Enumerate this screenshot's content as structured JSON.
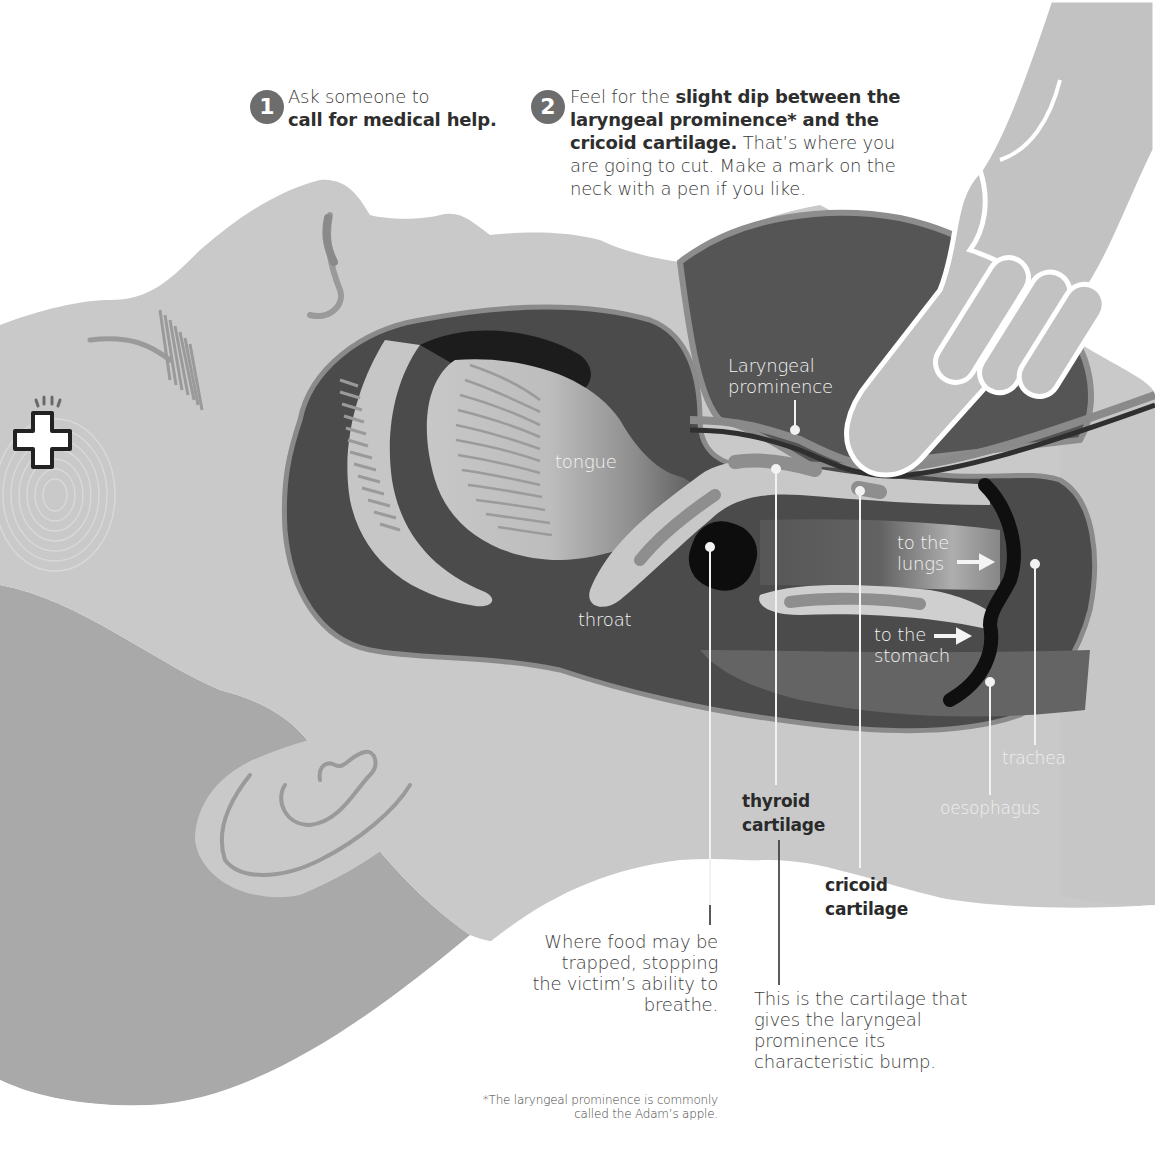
{
  "steps": [
    {
      "number": "1",
      "text_plain_1": "Ask someone to",
      "text_bold_1": "call for medical help."
    },
    {
      "number": "2",
      "text_plain_1": "Feel for the ",
      "text_bold_1": "slight dip between the laryngeal prominence* and the cricoid cartilage.",
      "text_plain_2": " That’s where you are going to cut. Make a mark on the neck with a pen if you like."
    }
  ],
  "labels": {
    "laryngeal_prominence": "Laryngeal prominence",
    "tongue": "tongue",
    "throat": "throat",
    "to_the_lungs": "to the lungs",
    "to_the_stomach": "to the stomach",
    "trachea": "trachea",
    "oesophagus": "oesophagus",
    "thyroid_cartilage": "thyroid cartilage",
    "cricoid_cartilage": "cricoid cartilage"
  },
  "notes": {
    "food_trapped": "Where food may be trapped, stopping the victim’s ability to breathe.",
    "thyroid_bump": "This is the cartilage that gives the laryngeal prominence its characteristic bump."
  },
  "footnote": "*The laryngeal prominence is commonly called the Adam’s apple.",
  "icons": {
    "medical": "medical-cross-icon",
    "fingerprint": "fingerprint-icon",
    "hand": "pointing-hand-icon",
    "arrow": "right-arrow-icon"
  },
  "colors": {
    "skin_light": "#c9c9c9",
    "skin_mid": "#a7a7a7",
    "cavity_dark": "#4a4a4a",
    "black": "#111111",
    "step_badge": "#6d6d6d",
    "text": "#3a3a3a",
    "white_text": "#f4f4f4"
  }
}
